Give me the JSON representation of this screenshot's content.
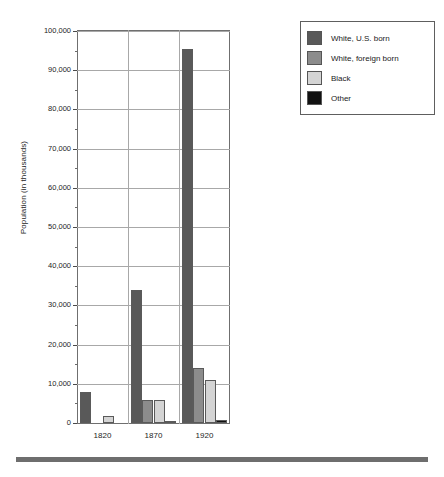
{
  "chart_data": {
    "type": "bar",
    "title": "",
    "subtitle": "",
    "xlabel": "",
    "ylabel": "Population (in thousands)",
    "categories": [
      "1820",
      "1870",
      "1920"
    ],
    "ylim": [
      0,
      100000
    ],
    "ytick_labels": [
      "0",
      "10,000",
      "20,000",
      "30,000",
      "40,000",
      "50,000",
      "60,000",
      "70,000",
      "80,000",
      "90,000",
      "100,000"
    ],
    "ytick_values": [
      0,
      10000,
      20000,
      30000,
      40000,
      50000,
      60000,
      70000,
      80000,
      90000,
      100000
    ],
    "grid": true,
    "legend_position": "top-right",
    "series": [
      {
        "name": "White, U.S. born",
        "color": "#595959",
        "values": [
          7900,
          33900,
          95400
        ]
      },
      {
        "name": "White, foreign born",
        "color": "#8c8c8c",
        "values": [
          0,
          5800,
          14000
        ]
      },
      {
        "name": "Black",
        "color": "#d4d4d4",
        "values": [
          1900,
          5800,
          10900
        ]
      },
      {
        "name": "Other",
        "color": "#111111",
        "values": [
          0,
          120,
          800
        ]
      }
    ]
  },
  "legend": {
    "items": [
      {
        "label": "White, U.S. born",
        "color": "#595959"
      },
      {
        "label": "White, foreign born",
        "color": "#8c8c8c"
      },
      {
        "label": "Black",
        "color": "#d4d4d4"
      },
      {
        "label": "Other",
        "color": "#111111"
      }
    ]
  }
}
